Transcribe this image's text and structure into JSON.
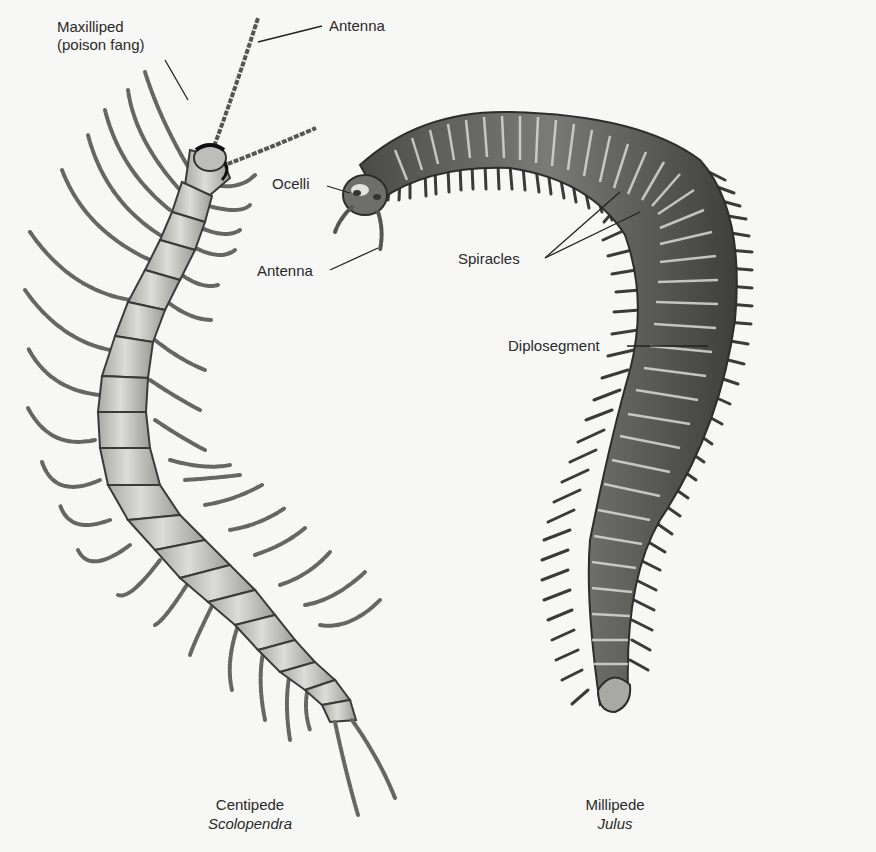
{
  "figure": {
    "centipede": {
      "common_name": "Centipede",
      "scientific_name": "Scolopendra",
      "labels": {
        "maxilliped_line1": "Maxilliped",
        "maxilliped_line2": "(poison fang)",
        "antenna": "Antenna"
      }
    },
    "millipede": {
      "common_name": "Millipede",
      "scientific_name": "Julus",
      "labels": {
        "ocelli": "Ocelli",
        "antenna": "Antenna",
        "spiracles": "Spiracles",
        "diplosegment": "Diplosegment"
      }
    },
    "colors": {
      "background": "#f7f7f5",
      "centipede_body": "#c9c9c6",
      "centipede_outline": "#3a3a3a",
      "millipede_body": "#5e5e5c",
      "millipede_highlight": "#d8d8d4",
      "label_text": "#2a2a2a"
    }
  }
}
